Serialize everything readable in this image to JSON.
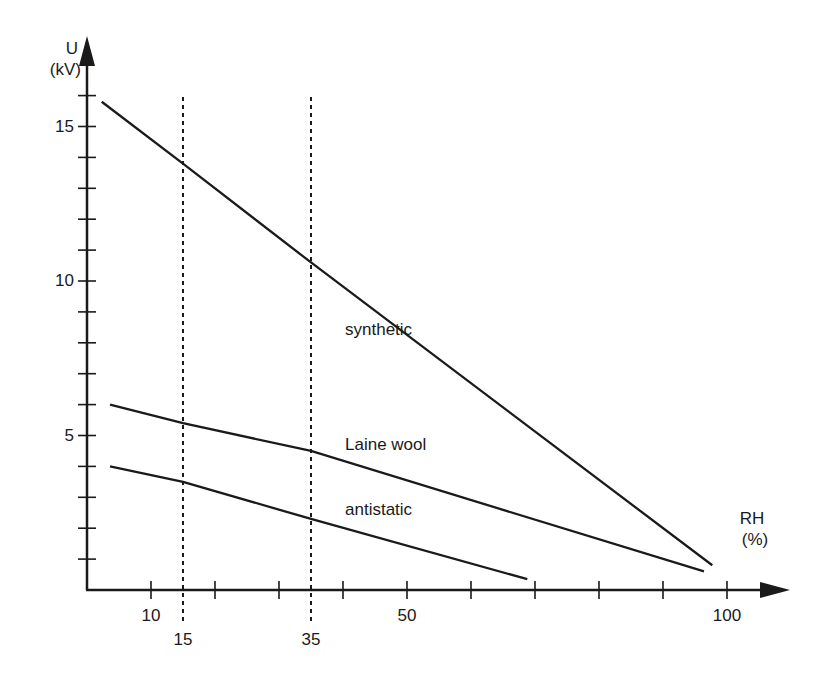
{
  "chart_data": {
    "type": "line",
    "title": "",
    "xlabel": "RH (%)",
    "ylabel": "U (kV)",
    "xlabel_lines": [
      "RH",
      "(%)"
    ],
    "ylabel_lines": [
      "U",
      "(kV)"
    ],
    "xlim": [
      0,
      110
    ],
    "ylim": [
      0,
      17
    ],
    "grid": false,
    "legend": "inline labels",
    "x_tick_labels": [
      {
        "value": 10,
        "label": "10"
      },
      {
        "value": 50,
        "label": "50"
      },
      {
        "value": 100,
        "label": "100"
      }
    ],
    "x_minor_ticks": [
      10,
      20,
      30,
      40,
      50,
      60,
      70,
      80,
      90,
      100
    ],
    "x_reference_lines": [
      {
        "value": 15,
        "label": "15",
        "style": "dashed"
      },
      {
        "value": 35,
        "label": "35",
        "style": "dashed"
      }
    ],
    "y_tick_labels": [
      {
        "value": 5,
        "label": "5"
      },
      {
        "value": 10,
        "label": "10"
      },
      {
        "value": 15,
        "label": "15"
      }
    ],
    "y_minor_ticks": [
      1,
      2,
      3,
      4,
      5,
      6,
      7,
      8,
      9,
      10,
      11,
      12,
      13,
      14,
      15,
      16
    ],
    "series": [
      {
        "name": "synthetic",
        "x": [
          2.3,
          15,
          35,
          97.7
        ],
        "y": [
          15.8,
          13.8,
          10.6,
          0.8
        ],
        "label_pos": {
          "x": 40,
          "y": 8.4
        }
      },
      {
        "name": "Laine wool",
        "x": [
          3.6,
          15,
          35,
          96.4
        ],
        "y": [
          6.0,
          5.4,
          4.5,
          0.6
        ],
        "label_pos": {
          "x": 40,
          "y": 4.7
        }
      },
      {
        "name": "antistatic",
        "x": [
          3.6,
          15,
          35,
          68.8
        ],
        "y": [
          4.0,
          3.5,
          2.3,
          0.35
        ],
        "label_pos": {
          "x": 40,
          "y": 2.6
        }
      }
    ]
  },
  "colors": {
    "line": "#1a1a1a",
    "background": "#ffffff"
  }
}
